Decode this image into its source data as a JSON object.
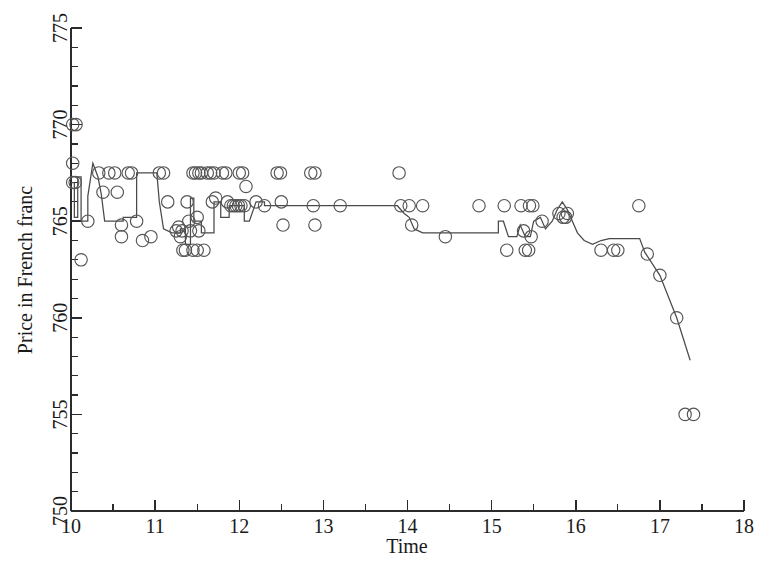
{
  "chart_data": {
    "type": "scatter",
    "title": "",
    "xlabel": "Time",
    "ylabel": "Price in French franc",
    "xlim": [
      10,
      18
    ],
    "ylim": [
      750,
      775
    ],
    "xticks": [
      10,
      11,
      12,
      13,
      14,
      15,
      16,
      17,
      18
    ],
    "yticks": [
      750,
      755,
      760,
      765,
      770,
      775
    ],
    "xtick_labels": [
      "10",
      "11",
      "12",
      "13",
      "14",
      "15",
      "16",
      "17",
      "18"
    ],
    "ytick_labels": [
      "750",
      "755",
      "760",
      "765",
      "770",
      "775"
    ],
    "x_minor_step": 0.5,
    "y_minor_step": 1,
    "grid": false,
    "legend": null,
    "marker": "open-circle",
    "marker_color": "#555555",
    "line_color": "#4a4a4a",
    "series": [
      {
        "name": "transaction prices",
        "type": "scatter",
        "points": [
          [
            10.02,
            770.0
          ],
          [
            10.06,
            770.0
          ],
          [
            10.02,
            768.0
          ],
          [
            10.02,
            767.0
          ],
          [
            10.05,
            767.0
          ],
          [
            10.12,
            763.0
          ],
          [
            10.2,
            765.0
          ],
          [
            10.33,
            767.5
          ],
          [
            10.38,
            766.5
          ],
          [
            10.45,
            767.5
          ],
          [
            10.52,
            767.5
          ],
          [
            10.55,
            766.5
          ],
          [
            10.6,
            764.8
          ],
          [
            10.6,
            764.2
          ],
          [
            10.68,
            767.5
          ],
          [
            10.72,
            767.5
          ],
          [
            10.78,
            765.0
          ],
          [
            10.85,
            764.0
          ],
          [
            10.95,
            764.2
          ],
          [
            11.05,
            767.5
          ],
          [
            11.1,
            767.5
          ],
          [
            11.15,
            766.0
          ],
          [
            11.25,
            764.5
          ],
          [
            11.28,
            764.7
          ],
          [
            11.3,
            764.2
          ],
          [
            11.32,
            764.5
          ],
          [
            11.33,
            763.5
          ],
          [
            11.36,
            763.5
          ],
          [
            11.38,
            766.0
          ],
          [
            11.4,
            765.0
          ],
          [
            11.42,
            764.5
          ],
          [
            11.45,
            767.5
          ],
          [
            11.48,
            767.5
          ],
          [
            11.52,
            767.5
          ],
          [
            11.55,
            767.5
          ],
          [
            11.5,
            765.2
          ],
          [
            11.52,
            764.5
          ],
          [
            11.45,
            763.5
          ],
          [
            11.5,
            763.5
          ],
          [
            11.58,
            763.5
          ],
          [
            11.62,
            767.5
          ],
          [
            11.66,
            767.5
          ],
          [
            11.7,
            767.5
          ],
          [
            11.68,
            766.0
          ],
          [
            11.72,
            766.2
          ],
          [
            11.8,
            767.5
          ],
          [
            11.84,
            767.5
          ],
          [
            11.86,
            766.0
          ],
          [
            11.9,
            765.8
          ],
          [
            11.93,
            765.8
          ],
          [
            11.96,
            765.8
          ],
          [
            11.99,
            765.8
          ],
          [
            12.0,
            767.5
          ],
          [
            12.04,
            767.5
          ],
          [
            12.02,
            765.8
          ],
          [
            12.06,
            765.8
          ],
          [
            12.08,
            766.8
          ],
          [
            12.2,
            766.0
          ],
          [
            12.3,
            765.8
          ],
          [
            12.45,
            767.5
          ],
          [
            12.49,
            767.5
          ],
          [
            12.5,
            766.0
          ],
          [
            12.52,
            764.8
          ],
          [
            12.85,
            767.5
          ],
          [
            12.9,
            767.5
          ],
          [
            12.88,
            765.8
          ],
          [
            12.9,
            764.8
          ],
          [
            13.2,
            765.8
          ],
          [
            13.9,
            767.5
          ],
          [
            13.92,
            765.8
          ],
          [
            14.02,
            765.8
          ],
          [
            14.05,
            764.8
          ],
          [
            14.18,
            765.8
          ],
          [
            14.45,
            764.2
          ],
          [
            14.85,
            765.8
          ],
          [
            15.15,
            765.8
          ],
          [
            15.18,
            763.5
          ],
          [
            15.35,
            765.8
          ],
          [
            15.38,
            764.5
          ],
          [
            15.4,
            763.5
          ],
          [
            15.44,
            763.5
          ],
          [
            15.45,
            765.8
          ],
          [
            15.49,
            765.8
          ],
          [
            15.47,
            764.2
          ],
          [
            15.6,
            765.0
          ],
          [
            15.8,
            765.4
          ],
          [
            15.85,
            765.2
          ],
          [
            15.88,
            765.2
          ],
          [
            15.9,
            765.4
          ],
          [
            16.3,
            763.5
          ],
          [
            16.45,
            763.5
          ],
          [
            16.5,
            763.5
          ],
          [
            16.75,
            765.8
          ],
          [
            16.85,
            763.3
          ],
          [
            17.0,
            762.2
          ],
          [
            17.2,
            760.0
          ],
          [
            17.3,
            755.0
          ],
          [
            17.4,
            755.0
          ]
        ]
      },
      {
        "name": "reference price path",
        "type": "line",
        "points": [
          [
            10.0,
            767.0
          ],
          [
            10.04,
            767.0
          ],
          [
            10.04,
            765.2
          ],
          [
            10.08,
            765.2
          ],
          [
            10.08,
            767.3
          ],
          [
            10.12,
            767.3
          ],
          [
            10.12,
            765.0
          ],
          [
            10.2,
            765.0
          ],
          [
            10.2,
            766.3
          ],
          [
            10.26,
            768.0
          ],
          [
            10.32,
            767.3
          ],
          [
            10.36,
            766.4
          ],
          [
            10.4,
            765.0
          ],
          [
            10.62,
            765.0
          ],
          [
            10.62,
            765.2
          ],
          [
            10.78,
            765.2
          ],
          [
            10.78,
            767.5
          ],
          [
            11.02,
            767.5
          ],
          [
            11.05,
            766.0
          ],
          [
            11.1,
            764.6
          ],
          [
            11.2,
            764.4
          ],
          [
            11.3,
            764.4
          ],
          [
            11.3,
            764.6
          ],
          [
            11.36,
            764.6
          ],
          [
            11.36,
            763.8
          ],
          [
            11.42,
            763.8
          ],
          [
            11.42,
            766.2
          ],
          [
            11.46,
            766.2
          ],
          [
            11.46,
            765.0
          ],
          [
            11.55,
            765.0
          ],
          [
            11.55,
            764.4
          ],
          [
            11.7,
            764.4
          ],
          [
            11.7,
            766.0
          ],
          [
            11.78,
            766.0
          ],
          [
            11.78,
            765.2
          ],
          [
            11.88,
            765.2
          ],
          [
            11.88,
            765.8
          ],
          [
            12.06,
            765.8
          ],
          [
            12.06,
            765.0
          ],
          [
            12.12,
            765.0
          ],
          [
            12.2,
            766.0
          ],
          [
            12.3,
            766.0
          ],
          [
            12.3,
            765.8
          ],
          [
            13.88,
            765.8
          ],
          [
            13.96,
            765.4
          ],
          [
            14.02,
            765.2
          ],
          [
            14.08,
            764.6
          ],
          [
            14.18,
            764.4
          ],
          [
            15.08,
            764.4
          ],
          [
            15.08,
            765.0
          ],
          [
            15.14,
            765.0
          ],
          [
            15.2,
            764.2
          ],
          [
            15.3,
            764.2
          ],
          [
            15.34,
            764.8
          ],
          [
            15.4,
            764.2
          ],
          [
            15.46,
            764.2
          ],
          [
            15.5,
            765.0
          ],
          [
            15.58,
            765.2
          ],
          [
            15.64,
            764.6
          ],
          [
            15.72,
            765.0
          ],
          [
            15.78,
            765.6
          ],
          [
            15.84,
            766.0
          ],
          [
            15.9,
            765.6
          ],
          [
            15.96,
            765.0
          ],
          [
            16.02,
            764.4
          ],
          [
            16.1,
            764.0
          ],
          [
            16.2,
            763.8
          ],
          [
            16.3,
            764.0
          ],
          [
            16.4,
            764.1
          ],
          [
            16.5,
            764.1
          ],
          [
            16.6,
            764.1
          ],
          [
            16.76,
            764.1
          ],
          [
            16.82,
            763.4
          ],
          [
            17.0,
            762.2
          ],
          [
            17.2,
            760.0
          ],
          [
            17.36,
            757.8
          ]
        ]
      }
    ]
  },
  "axes": {
    "x_title": "Time",
    "y_title": "Price in French franc"
  }
}
